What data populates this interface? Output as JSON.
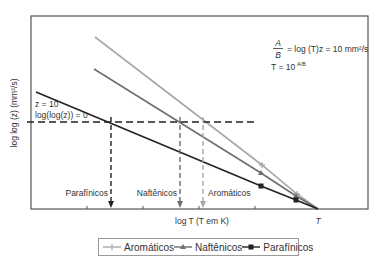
{
  "chart_data": {
    "type": "line",
    "title": "",
    "xlabel": "log T (T em K)",
    "ylabel": "log log (z) (mm²/s)",
    "x_axis_end_label": "T",
    "grid": false,
    "legend_position": "bottom",
    "series": [
      {
        "name": "Aromáticos",
        "color": "#a8a8a8",
        "marker": "plus",
        "points": [
          [
            95,
            37
          ],
          [
            262,
            165
          ],
          [
            297,
            194
          ],
          [
            318,
            209
          ]
        ]
      },
      {
        "name": "Naftênicos",
        "color": "#6e6e6e",
        "marker": "triangle",
        "points": [
          [
            94,
            69
          ],
          [
            261,
            173
          ],
          [
            296,
            196
          ],
          [
            318,
            209
          ]
        ]
      },
      {
        "name": "Parafínicos",
        "color": "#222222",
        "marker": "square",
        "points": [
          [
            36,
            92
          ],
          [
            261,
            186
          ],
          [
            296,
            200
          ],
          [
            318,
            209
          ]
        ]
      }
    ],
    "reference_line": {
      "label_line1": "z = 10",
      "label_line2": "log(log(z)) = 0",
      "y": 122
    },
    "intersections": [
      {
        "name": "Parafínicos",
        "x": 111,
        "color": "#222222"
      },
      {
        "name": "Naftênicos",
        "x": 180,
        "color": "#6e6e6e"
      },
      {
        "name": "Aromáticos",
        "x": 203,
        "color": "#a8a8a8"
      }
    ],
    "annotations": {
      "formula_fraction_num": "A",
      "formula_fraction_den": "B",
      "formula_rhs": "= log (T)z = 10 mm²/s",
      "formula_T": "T = 10",
      "formula_T_exp": "A/B"
    }
  },
  "legend": {
    "items": [
      {
        "label": "Aromáticos"
      },
      {
        "label": "Naftênicos"
      },
      {
        "label": "Parafínicos"
      }
    ]
  }
}
